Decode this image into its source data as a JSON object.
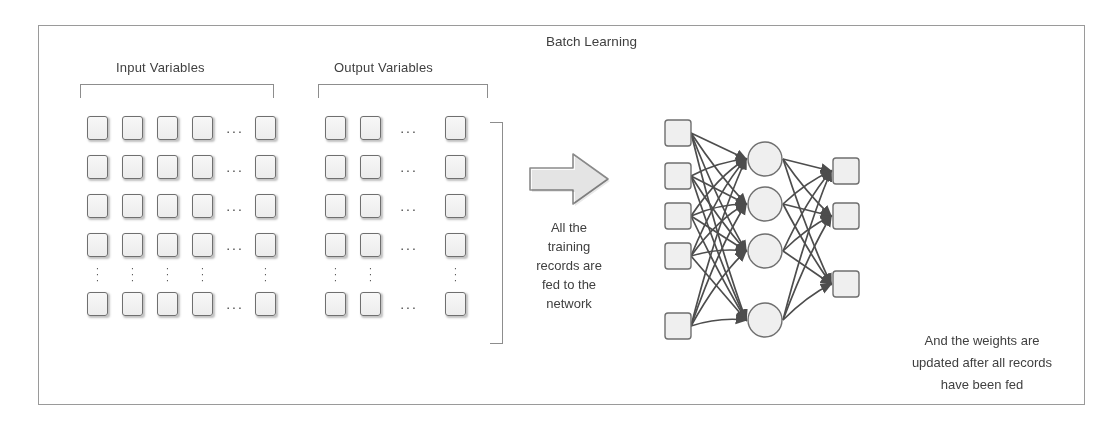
{
  "diagram": {
    "title": "Batch Learning",
    "labels": {
      "input_variables": "Input Variables",
      "output_variables": "Output Variables"
    },
    "captions": {
      "middle": "All the training records are fed to the network",
      "middle_lines": [
        "All the",
        "training",
        "records are",
        "fed to the",
        "network"
      ],
      "right": "And the weights are updated after all records have been fed",
      "right_lines": [
        "And the weights are",
        "updated after all records",
        "have been fed"
      ]
    },
    "ellipsis": {
      "horizontal": "...",
      "vertical_dot": "·"
    },
    "input_grid": {
      "rows": 5,
      "columns_before_ellipsis": 4,
      "columns_after_ellipsis": 1,
      "ellipsis_row_index": 4,
      "col_x": [
        87,
        122,
        157,
        192,
        255
      ],
      "row_y": [
        116,
        155,
        194,
        233,
        292
      ],
      "hdots_x": 222,
      "vdots_y": 266
    },
    "output_grid": {
      "rows": 5,
      "columns_before_ellipsis": 2,
      "columns_after_ellipsis": 1,
      "ellipsis_row_index": 4,
      "col_x": [
        325,
        360,
        445
      ],
      "row_y": [
        116,
        155,
        194,
        233,
        292
      ],
      "hdots_x": 396,
      "vdots_y": 266
    },
    "network": {
      "input_nodes": 5,
      "hidden_nodes": 4,
      "output_nodes": 3,
      "input_y": [
        25,
        68,
        108,
        148,
        218
      ],
      "hidden_y": [
        47,
        92,
        139,
        208
      ],
      "output_y": [
        63,
        108,
        176
      ],
      "input_x": 10,
      "hidden_cx": 110,
      "output_x": 178,
      "node_w": 26,
      "node_h": 26,
      "hidden_r": 17
    },
    "colors": {
      "frame_border": "#9a9a9a",
      "node_fill": "#efefef",
      "node_stroke": "#6f6f6f",
      "edge": "#4d4d4d",
      "text": "#404040",
      "bracket": "#8d8d8d",
      "arrow_fill": "#fbfbfb",
      "arrow_stroke": "#8a8a8a"
    }
  }
}
